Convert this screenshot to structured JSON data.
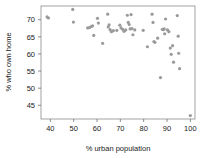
{
  "chart_data": {
    "type": "scatter",
    "title": "",
    "xlabel": "% urban population",
    "ylabel": "% who own home",
    "xlim": [
      36,
      102
    ],
    "ylim": [
      41,
      74
    ],
    "xticks": [
      40,
      50,
      60,
      70,
      80,
      90,
      100
    ],
    "yticks": [
      45,
      50,
      55,
      60,
      65,
      70
    ],
    "xtick_labels": [
      "40",
      "50",
      "60",
      "70",
      "80",
      "90",
      "100"
    ],
    "ytick_labels": [
      "45",
      "50",
      "55",
      "60",
      "65",
      "70"
    ],
    "grid": false,
    "legend": null,
    "marker": {
      "shape": "circle",
      "color": "#9a9a9a",
      "radius": 1.6
    },
    "points": [
      {
        "x": 38.6,
        "y": 70.8
      },
      {
        "x": 39.2,
        "y": 70.5
      },
      {
        "x": 49.6,
        "y": 73.0
      },
      {
        "x": 49.9,
        "y": 69.3
      },
      {
        "x": 56.0,
        "y": 67.6
      },
      {
        "x": 56.8,
        "y": 67.7
      },
      {
        "x": 57.5,
        "y": 68.0
      },
      {
        "x": 58.1,
        "y": 68.2
      },
      {
        "x": 58.6,
        "y": 65.4
      },
      {
        "x": 60.2,
        "y": 70.4
      },
      {
        "x": 60.6,
        "y": 69.0
      },
      {
        "x": 62.4,
        "y": 63.1
      },
      {
        "x": 64.6,
        "y": 71.6
      },
      {
        "x": 64.8,
        "y": 67.9
      },
      {
        "x": 65.2,
        "y": 68.5
      },
      {
        "x": 65.6,
        "y": 67.1
      },
      {
        "x": 66.2,
        "y": 66.5
      },
      {
        "x": 67.0,
        "y": 66.8
      },
      {
        "x": 68.5,
        "y": 66.9
      },
      {
        "x": 69.8,
        "y": 68.4
      },
      {
        "x": 70.3,
        "y": 67.6
      },
      {
        "x": 71.0,
        "y": 67.2
      },
      {
        "x": 71.6,
        "y": 66.6
      },
      {
        "x": 72.3,
        "y": 67.0
      },
      {
        "x": 73.0,
        "y": 71.3
      },
      {
        "x": 73.4,
        "y": 69.2
      },
      {
        "x": 73.8,
        "y": 68.6
      },
      {
        "x": 74.2,
        "y": 67.3
      },
      {
        "x": 74.6,
        "y": 71.5
      },
      {
        "x": 75.0,
        "y": 67.4
      },
      {
        "x": 75.4,
        "y": 65.6
      },
      {
        "x": 76.2,
        "y": 67.0
      },
      {
        "x": 79.8,
        "y": 66.9
      },
      {
        "x": 81.6,
        "y": 62.1
      },
      {
        "x": 83.6,
        "y": 71.6
      },
      {
        "x": 84.0,
        "y": 69.2
      },
      {
        "x": 84.4,
        "y": 63.6
      },
      {
        "x": 84.8,
        "y": 63.4
      },
      {
        "x": 86.0,
        "y": 64.6
      },
      {
        "x": 87.2,
        "y": 53.1
      },
      {
        "x": 88.0,
        "y": 67.2
      },
      {
        "x": 88.4,
        "y": 67.1
      },
      {
        "x": 88.8,
        "y": 67.3
      },
      {
        "x": 89.0,
        "y": 65.9
      },
      {
        "x": 89.4,
        "y": 70.2
      },
      {
        "x": 90.2,
        "y": 67.0
      },
      {
        "x": 90.8,
        "y": 66.5
      },
      {
        "x": 91.4,
        "y": 61.7
      },
      {
        "x": 91.8,
        "y": 59.9
      },
      {
        "x": 92.4,
        "y": 62.4
      },
      {
        "x": 92.8,
        "y": 57.6
      },
      {
        "x": 94.4,
        "y": 71.2
      },
      {
        "x": 94.8,
        "y": 65.2
      },
      {
        "x": 95.0,
        "y": 60.2
      },
      {
        "x": 95.4,
        "y": 55.7
      },
      {
        "x": 100.0,
        "y": 42.0
      }
    ]
  },
  "colors": {
    "marker": "#9a9a9a",
    "axis": "#8c8c8c",
    "text": "#1a1a1a",
    "background": "#ffffff"
  }
}
